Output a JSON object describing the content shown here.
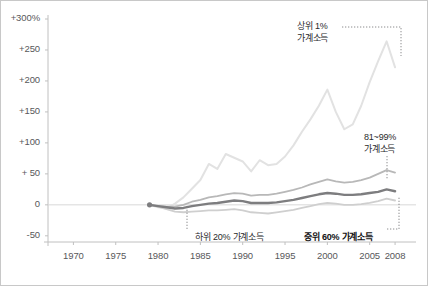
{
  "chart_data": {
    "type": "line",
    "title": "",
    "subtitle": "",
    "xlabel": "",
    "ylabel": "",
    "xlim": [
      1967,
      2010
    ],
    "ylim": [
      -60,
      300
    ],
    "grid": false,
    "legend_position": "inline-annotations",
    "y_ticks": [
      {
        "value": 300,
        "label": "+300%"
      },
      {
        "value": 250,
        "label": "+250"
      },
      {
        "value": 200,
        "label": "+200"
      },
      {
        "value": 150,
        "label": "+150"
      },
      {
        "value": 100,
        "label": "+100"
      },
      {
        "value": 50,
        "label": "+ 50"
      },
      {
        "value": 0,
        "label": "0"
      },
      {
        "value": -50,
        "label": "-50"
      }
    ],
    "x_ticks": [
      {
        "value": 1970,
        "label": "1970"
      },
      {
        "value": 1975,
        "label": "1975"
      },
      {
        "value": 1980,
        "label": "1980"
      },
      {
        "value": 1985,
        "label": "1985"
      },
      {
        "value": 1990,
        "label": "1990"
      },
      {
        "value": 1995,
        "label": "1995"
      },
      {
        "value": 2000,
        "label": "2000"
      },
      {
        "value": 2005,
        "label": "2005"
      },
      {
        "value": 2008,
        "label": "2008"
      }
    ],
    "x": [
      1979,
      1980,
      1981,
      1982,
      1983,
      1984,
      1985,
      1986,
      1987,
      1988,
      1989,
      1990,
      1991,
      1992,
      1993,
      1994,
      1995,
      1996,
      1997,
      1998,
      1999,
      2000,
      2001,
      2002,
      2003,
      2004,
      2005,
      2006,
      2007,
      2008
    ],
    "series": [
      {
        "name": "상위 1% 가계소득",
        "key": "top1",
        "color": "#e2e2e2",
        "width": 2.0,
        "values": [
          0,
          -4,
          -6,
          2,
          12,
          26,
          40,
          66,
          58,
          82,
          76,
          70,
          54,
          72,
          64,
          66,
          78,
          96,
          118,
          138,
          160,
          186,
          150,
          122,
          130,
          160,
          198,
          232,
          264,
          222
        ]
      },
      {
        "name": "81~99% 가계소득",
        "key": "p81_99",
        "color": "#b8b8b8",
        "width": 1.8,
        "values": [
          0,
          -2,
          -3,
          -3,
          0,
          5,
          8,
          12,
          14,
          17,
          19,
          18,
          15,
          16,
          16,
          18,
          21,
          24,
          28,
          33,
          37,
          41,
          38,
          36,
          37,
          40,
          44,
          50,
          56,
          52
        ]
      },
      {
        "name": "중위 60% 가계소득",
        "key": "mid60",
        "color": "#7d7d7f",
        "width": 2.4,
        "values": [
          0,
          -2,
          -4,
          -6,
          -5,
          -2,
          0,
          2,
          3,
          5,
          7,
          6,
          3,
          3,
          3,
          4,
          6,
          8,
          11,
          14,
          17,
          19,
          18,
          16,
          16,
          17,
          19,
          21,
          25,
          22
        ]
      },
      {
        "name": "하위 20% 가계소득",
        "key": "bottom20",
        "color": "#cfcfcf",
        "width": 1.8,
        "values": [
          0,
          -3,
          -7,
          -11,
          -12,
          -11,
          -10,
          -9,
          -9,
          -8,
          -7,
          -9,
          -12,
          -13,
          -14,
          -12,
          -10,
          -8,
          -5,
          -2,
          1,
          3,
          2,
          0,
          0,
          1,
          3,
          6,
          10,
          7
        ]
      }
    ],
    "annotations": [
      {
        "key": "top1",
        "lines": [
          "상위 1%",
          "가계소득"
        ],
        "text_x": 296,
        "text_y": 20,
        "align": "left"
      },
      {
        "key": "p81_99",
        "lines": [
          "81~99%",
          "가계소득"
        ],
        "text_x": 363,
        "text_y": 131,
        "align": "left"
      },
      {
        "key": "bottom20",
        "lines": [
          "하위 20% 가계소득"
        ],
        "text_x": 194,
        "text_y": 231,
        "align": "left",
        "bold": false
      },
      {
        "key": "mid60",
        "lines": [
          "중위 60% 가계소득"
        ],
        "text_x": 303,
        "text_y": 231,
        "align": "left",
        "bold": true
      }
    ],
    "start_marker": {
      "x": 1979,
      "y": 0
    },
    "zero_line_color": "#d8d8d8",
    "axis_color": "#c0c0c0",
    "tick_label_color": "#58585a"
  }
}
